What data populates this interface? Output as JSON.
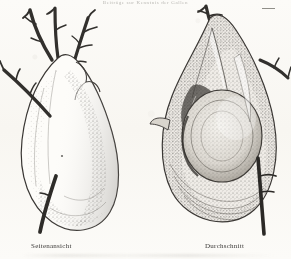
{
  "page": {
    "background_color": "#fbfaf7",
    "ink_color": "#3b3937",
    "running_head": "Beiträge zur Kenntnis der Gallen",
    "top_mark": "—"
  },
  "plate": {
    "figures": [
      {
        "id": "side-view",
        "caption": "Seitenansicht",
        "subject": "plant gall on thorny twig, exterior side view",
        "elements": [
          "forked twig with lateral thorn spurs at top",
          "oblong swollen gall body",
          "lateral twig entering gall at left",
          "stippled shading on right flank"
        ]
      },
      {
        "id": "cross-section",
        "caption": "Durchschnitt",
        "subject": "plant gall cut open, longitudinal cross-section",
        "elements": [
          "tapering apex with thorny twig at top",
          "outer wall shell with stippled texture",
          "inner concentric larval chamber",
          "small lateral thorn at left margin",
          "dark twig stub exiting at lower right"
        ]
      }
    ]
  }
}
